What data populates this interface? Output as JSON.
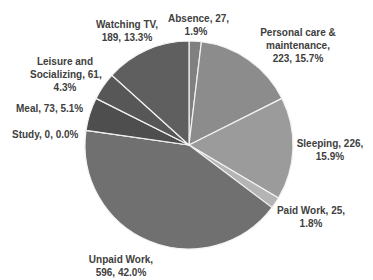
{
  "chart_data": {
    "type": "pie",
    "title": "",
    "start_angle_deg": 0,
    "direction": "clockwise",
    "total": 1420,
    "slices": [
      {
        "label": "Absence",
        "value": 27,
        "percent": "1.9%",
        "color": "#808080"
      },
      {
        "label": "Personal care & maintenance",
        "value": 223,
        "percent": "15.7%",
        "color": "#8c8c8c"
      },
      {
        "label": "Sleeping",
        "value": 226,
        "percent": "15.9%",
        "color": "#9b9b9b"
      },
      {
        "label": "Paid Work",
        "value": 25,
        "percent": "1.8%",
        "color": "#b4b4b4"
      },
      {
        "label": "Unpaid Work",
        "value": 596,
        "percent": "42.0%",
        "color": "#707070"
      },
      {
        "label": "Study",
        "value": 0,
        "percent": "0.0%",
        "color": "#6a6a6a"
      },
      {
        "label": "Meal",
        "value": 73,
        "percent": "5.1%",
        "color": "#4e4e4e"
      },
      {
        "label": "Leisure and Socializing",
        "value": 61,
        "percent": "4.3%",
        "color": "#575757"
      },
      {
        "label": "Watching TV",
        "value": 189,
        "percent": "13.3%",
        "color": "#5f5f5f"
      }
    ]
  },
  "labels": {
    "absence": [
      "Absence, 27,",
      "1.9%"
    ],
    "personal_care": [
      "Personal care &",
      "maintenance,",
      "223, 15.7%"
    ],
    "sleeping": [
      "Sleeping, 226,",
      "15.9%"
    ],
    "paid_work": [
      "Paid Work, 25,",
      "1.8%"
    ],
    "unpaid_work": [
      "Unpaid Work,",
      "596, 42.0%"
    ],
    "study": [
      "Study, 0, 0.0%"
    ],
    "meal": [
      "Meal, 73, 5.1%"
    ],
    "leisure": [
      "Leisure and",
      "Socializing, 61,",
      "4.3%"
    ],
    "watching_tv": [
      "Watching TV,",
      "189, 13.3%"
    ]
  }
}
